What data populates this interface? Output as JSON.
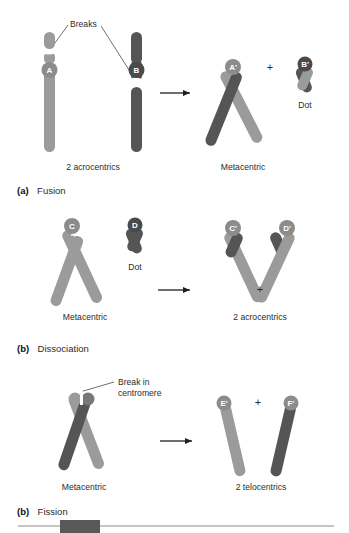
{
  "figure": {
    "title_present": false,
    "colors": {
      "light_arm": "#9b9b9b",
      "dark_arm": "#555555",
      "centromere_light": "#8c8c8c",
      "centromere_dark": "#4a4a4a",
      "text": "#2b2b2b",
      "rule": "#8a8a8a",
      "block": "#595959",
      "background": "#ffffff"
    }
  },
  "panels": [
    {
      "id": "panel-a",
      "caption_prefix": "(a)",
      "caption_title": "Fusion",
      "annotation": "Breaks",
      "left_label": "2 acrocentrics",
      "right_label": "Metacentric",
      "dot_label": "Dot",
      "plus": "+",
      "centromeres": [
        "A",
        "B",
        "A'",
        "B'"
      ]
    },
    {
      "id": "panel-b",
      "caption_prefix": "(b)",
      "caption_title": "Dissociation",
      "annotation": "",
      "left_label": "Metacentric",
      "right_label": "2 acrocentrics",
      "dot_label": "Dot",
      "plus": "+",
      "centromeres": [
        "C",
        "D",
        "C'",
        "D'"
      ]
    },
    {
      "id": "panel-c",
      "caption_prefix": "(b)",
      "caption_title": "Fission",
      "annotation_line1": "Break in",
      "annotation_line2": "centromere",
      "left_label": "Metacentric",
      "right_label": "2 telocentrics",
      "plus": "+",
      "centromeres": [
        "E'",
        "F'"
      ]
    }
  ],
  "footer": {
    "rule_present": true,
    "block_present": true
  }
}
